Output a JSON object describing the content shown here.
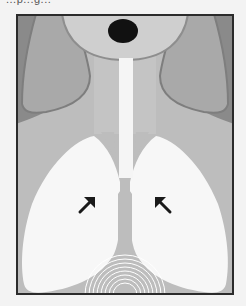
{
  "page": {
    "top_text_fragment": "...p...g..."
  },
  "figure": {
    "type": "anatomical-illustration",
    "elements": [
      {
        "name": "head",
        "shape": "ellipse"
      },
      {
        "name": "mouth",
        "shape": "ellipse",
        "color": "#111111"
      },
      {
        "name": "neck"
      },
      {
        "name": "trachea",
        "color": "#f5f5f5"
      },
      {
        "name": "left-lung",
        "color": "#f7f7f7"
      },
      {
        "name": "right-lung",
        "color": "#f7f7f7"
      },
      {
        "name": "left-arrow",
        "direction": "up-right"
      },
      {
        "name": "right-arrow",
        "direction": "up-left"
      },
      {
        "name": "diaphragm-waves",
        "count": 8
      }
    ],
    "colors": {
      "frame_border": "#2b2b2b",
      "shoulder_dark": "#8a8a8a",
      "shoulder_mid": "#a9a9a9",
      "body": "#bdbdbd",
      "head": "#cfcfcf",
      "lung": "#f7f7f7",
      "mouth": "#111111",
      "arrow": "#1a1a1a",
      "wave": "#ffffff"
    }
  }
}
